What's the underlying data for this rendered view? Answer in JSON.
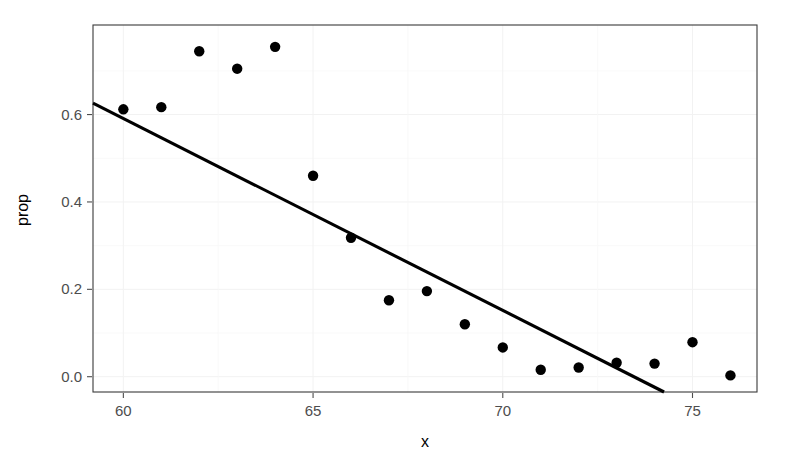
{
  "chart_data": {
    "type": "scatter",
    "title": "",
    "subtitle": "",
    "xlabel": "x",
    "ylabel": "prop",
    "xlim": [
      59.2,
      76.7
    ],
    "ylim": [
      -0.035,
      0.805
    ],
    "xticks": [
      60,
      65,
      70,
      75
    ],
    "xtick_labels": [
      "60",
      "65",
      "70",
      "75"
    ],
    "yticks": [
      0.0,
      0.2,
      0.4,
      0.6
    ],
    "ytick_labels": [
      "0.0",
      "0.2",
      "0.4",
      "0.6"
    ],
    "grid": true,
    "grid_major_color": "#f2f2f2",
    "grid_minor_color": "#f7f7f7",
    "legend": "none",
    "point_color": "#000000",
    "point_size": 5.2,
    "line_color": "#000000",
    "line_width": 3.1,
    "panel_border_color": "#3a3a3a",
    "background": "#ffffff",
    "x": [
      60,
      61,
      62,
      63,
      64,
      65,
      66,
      67,
      68,
      69,
      70,
      71,
      72,
      73,
      74,
      75,
      76
    ],
    "y": [
      0.612,
      0.617,
      0.745,
      0.705,
      0.755,
      0.46,
      0.318,
      0.175,
      0.196,
      0.12,
      0.067,
      0.016,
      0.021,
      0.032,
      0.03,
      0.079,
      0.003
    ],
    "series": [
      {
        "name": "prop",
        "type": "scatter",
        "points": [
          {
            "x": 60,
            "y": 0.612
          },
          {
            "x": 61,
            "y": 0.617
          },
          {
            "x": 62,
            "y": 0.745
          },
          {
            "x": 63,
            "y": 0.705
          },
          {
            "x": 64,
            "y": 0.755
          },
          {
            "x": 65,
            "y": 0.46
          },
          {
            "x": 66,
            "y": 0.318
          },
          {
            "x": 67,
            "y": 0.175
          },
          {
            "x": 68,
            "y": 0.196
          },
          {
            "x": 69,
            "y": 0.12
          },
          {
            "x": 70,
            "y": 0.067
          },
          {
            "x": 71,
            "y": 0.016
          },
          {
            "x": 72,
            "y": 0.021
          },
          {
            "x": 73,
            "y": 0.032
          },
          {
            "x": 74,
            "y": 0.03
          },
          {
            "x": 75,
            "y": 0.079
          },
          {
            "x": 76,
            "y": 0.003
          }
        ]
      },
      {
        "name": "fitted-line",
        "type": "line",
        "points": [
          {
            "x": 59.2,
            "y": 0.626
          },
          {
            "x": 74.25,
            "y": -0.035
          }
        ]
      }
    ]
  }
}
